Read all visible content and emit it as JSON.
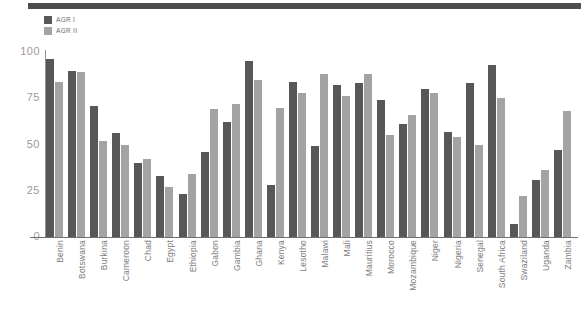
{
  "chart_data": {
    "type": "bar",
    "title": "",
    "subtitle": "",
    "xlabel": "",
    "ylabel": "",
    "ylim": [
      0,
      100
    ],
    "yticks": [
      0,
      25,
      50,
      75,
      100
    ],
    "ytick_labels": [
      "0",
      "25",
      "50",
      "75",
      "100"
    ],
    "grid": false,
    "legend_position": "top-left",
    "categories": [
      "Benin",
      "Botswana",
      "Burkina",
      "Cameroon",
      "Chad",
      "Egypt",
      "Ethiopia",
      "Gabon",
      "Gambia",
      "Ghana",
      "Kenya",
      "Lesotho",
      "Malawi",
      "Mali",
      "Mauritius",
      "Morocco",
      "Mozambique",
      "Niger",
      "Nigeria",
      "Senegal",
      "South Africa",
      "Swaziland",
      "Uganda",
      "Zambia"
    ],
    "series": [
      {
        "name": "AGR I",
        "color": "#575757",
        "values": [
          96,
          90,
          71,
          56,
          40,
          33,
          23,
          46,
          62,
          95,
          28,
          84,
          49,
          82,
          83,
          74,
          61,
          80,
          57,
          83,
          93,
          7,
          31,
          47
        ]
      },
      {
        "name": "AGR II",
        "color": "#a3a3a3",
        "values": [
          84,
          89,
          52,
          50,
          42,
          27,
          34,
          69,
          72,
          85,
          70,
          78,
          88,
          76,
          88,
          55,
          66,
          78,
          54,
          50,
          75,
          22,
          36,
          68
        ]
      }
    ]
  },
  "legend": {
    "items": [
      {
        "label": "AGR I",
        "color": "#575757"
      },
      {
        "label": "AGR II",
        "color": "#a3a3a3"
      }
    ]
  },
  "axes": {
    "y_tick_labels": [
      "100",
      "75",
      "50",
      "25",
      "0"
    ]
  },
  "colors": {
    "series1": "#575757",
    "series2": "#a3a3a3",
    "top_rule": "#4d4d4d",
    "axis": "#6f6f6f",
    "tick_text": "#9a9a9a",
    "category_text": "#7d7d7d",
    "background": "#ffffff"
  }
}
